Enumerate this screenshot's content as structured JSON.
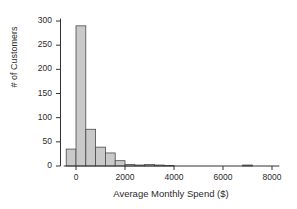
{
  "chart_data": {
    "type": "bar",
    "title": "",
    "subtitle": "",
    "xlabel": "Average Monthly Spend ($)",
    "ylabel": "# of Customers",
    "xlim": [
      -500,
      8300
    ],
    "ylim": [
      0,
      305
    ],
    "xticks": [
      0,
      2000,
      4000,
      6000,
      8000
    ],
    "xtick_labels": [
      "0",
      "2000",
      "4000",
      "6000",
      "8000"
    ],
    "yticks": [
      0,
      50,
      100,
      150,
      200,
      250,
      300
    ],
    "ytick_labels": [
      "0",
      "50",
      "100",
      "150",
      "200",
      "250",
      "300"
    ],
    "grid": false,
    "legend": false,
    "bin_width": 400,
    "bin_starts": [
      -400,
      0,
      400,
      800,
      1200,
      1600,
      2000,
      2400,
      2800,
      3200,
      3600,
      6800
    ],
    "categories": [
      "-400",
      "0",
      "400",
      "800",
      "1200",
      "1600",
      "2000",
      "2400",
      "2800",
      "3200",
      "3600",
      "6800"
    ],
    "values": [
      35,
      290,
      76,
      39,
      27,
      11,
      3,
      2,
      3,
      2,
      1,
      2
    ],
    "bar_fill": "#c9c9c9",
    "bar_edge": "#4a4a4a",
    "axis_color": "#333333"
  },
  "axes": {
    "x_tick_labels": [
      "0",
      "2000",
      "4000",
      "6000",
      "8000"
    ],
    "y_tick_labels": [
      "0",
      "50",
      "100",
      "150",
      "200",
      "250",
      "300"
    ],
    "x_title": "Average Monthly Spend ($)",
    "y_title": "# of Customers"
  }
}
